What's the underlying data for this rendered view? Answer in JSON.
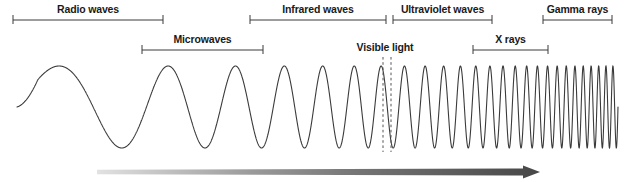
{
  "figure": {
    "width": 624,
    "height": 182,
    "background": "#ffffff",
    "line_color": "#3a3a3a",
    "text_color": "#1a1a1a"
  },
  "bands": [
    {
      "id": "radio-waves",
      "label": "Radio waves",
      "row": "top",
      "bracket": {
        "x1": 13,
        "x2": 163,
        "y": 20
      },
      "label_x": 88,
      "label_y": 5
    },
    {
      "id": "microwaves",
      "label": "Microwaves",
      "row": "bottom",
      "bracket": {
        "x1": 142,
        "x2": 263,
        "y": 50
      },
      "label_x": 202,
      "label_y": 35
    },
    {
      "id": "infrared-waves",
      "label": "Infrared waves",
      "row": "top",
      "bracket": {
        "x1": 250,
        "x2": 386,
        "y": 20
      },
      "label_x": 318,
      "label_y": 5
    },
    {
      "id": "visible-light",
      "label": "Visible light",
      "row": "bottom",
      "bracket": null,
      "label_x": 385,
      "label_y": 42
    },
    {
      "id": "ultraviolet-waves",
      "label": "Ultraviolet waves",
      "row": "top",
      "bracket": {
        "x1": 393,
        "x2": 492,
        "y": 20
      },
      "label_x": 443,
      "label_y": 5
    },
    {
      "id": "x-rays",
      "label": "X rays",
      "row": "bottom",
      "bracket": {
        "x1": 473,
        "x2": 548,
        "y": 50
      },
      "label_x": 511,
      "label_y": 35
    },
    {
      "id": "gamma-rays",
      "label": "Gamma rays",
      "row": "top",
      "bracket": {
        "x1": 543,
        "x2": 612,
        "y": 20
      },
      "label_x": 578,
      "label_y": 5
    }
  ],
  "visible_light_markers": {
    "name": "visible-light-dashed-lines",
    "x_positions": [
      383,
      391
    ],
    "y_top": 57,
    "y_bottom": 152,
    "color": "#555555"
  },
  "wave": {
    "name": "electromagnetic-wave",
    "x_start": 17,
    "x_end": 618,
    "center_y": 107,
    "amplitude": 41,
    "stroke": "#3a3a3a",
    "stroke_width": 1.1,
    "description": "Sinusoid whose frequency increases continuously from left (long wavelength, radio) to right (short wavelength, gamma)",
    "cycles_total": 26
  },
  "frequency_arrow": {
    "name": "increasing-frequency-arrow",
    "x_start": 97,
    "x_tip": 540,
    "y_center": 172,
    "thickness": 7,
    "gradient_from": "#d9d9d9",
    "gradient_to": "#4a4a4a",
    "direction": "right"
  }
}
